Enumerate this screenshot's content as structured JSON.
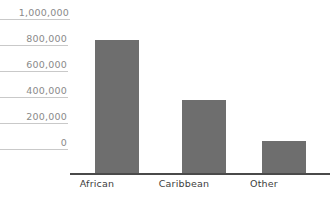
{
  "chart_data": {
    "type": "bar",
    "title": "",
    "subtitle": "",
    "xlabel": "",
    "ylabel": "",
    "categories": [
      "African",
      "Caribbean",
      "Other"
    ],
    "values": [
      1030000,
      570000,
      255000
    ],
    "series": [
      {
        "name": "Population",
        "values": [
          1030000,
          570000,
          255000
        ]
      }
    ],
    "ylim": [
      0,
      1000000
    ],
    "yticks": [
      0,
      200000,
      400000,
      600000,
      800000,
      1000000
    ],
    "ytick_labels": [
      "0",
      "200,000",
      "400,000",
      "600,000",
      "800,000",
      "1,000,000"
    ],
    "grid": false,
    "legend": "none",
    "bar_color": "#6e6e6e",
    "axis_color": "#4a4a4a",
    "tick_label_color": "#8a8a8a",
    "category_label_color": "#3d3d3d"
  },
  "axis": {
    "y_ticks": [
      {
        "label": "1,000,000",
        "value": 1000000
      },
      {
        "label": "800,000",
        "value": 800000
      },
      {
        "label": "600,000",
        "value": 600000
      },
      {
        "label": "400,000",
        "value": 400000
      },
      {
        "label": "200,000",
        "value": 200000
      },
      {
        "label": "0",
        "value": 0
      }
    ],
    "x_labels": [
      "African",
      "Caribbean",
      "Other"
    ]
  }
}
